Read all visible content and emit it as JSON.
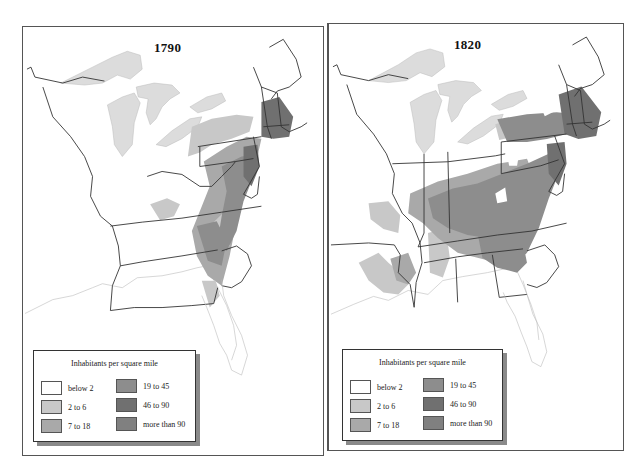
{
  "density_classes": [
    {
      "label": "below 2",
      "color": "#ffffff"
    },
    {
      "label": "2 to 6",
      "color": "#c8c8c8"
    },
    {
      "label": "7 to 18",
      "color": "#a9a9a9"
    },
    {
      "label": "19 to 45",
      "color": "#8d8d8d"
    },
    {
      "label": "46 to 90",
      "color": "#707070"
    },
    {
      "label": "more than 90",
      "color": "#808080"
    }
  ],
  "water_color": "#dcdcdc",
  "maps": [
    {
      "year": "1790",
      "legend": {
        "title": "Inhabitants per square mile",
        "items": [
          "below 2",
          "2 to 6",
          "7 to 18",
          "19 to 45",
          "46 to 90",
          "more than 90"
        ]
      }
    },
    {
      "year": "1820",
      "legend": {
        "title": "Inhabitants per square mile",
        "items": [
          "below 2",
          "2 to 6",
          "7 to 18",
          "19 to 45",
          "46 to 90",
          "more than 90"
        ]
      }
    }
  ]
}
